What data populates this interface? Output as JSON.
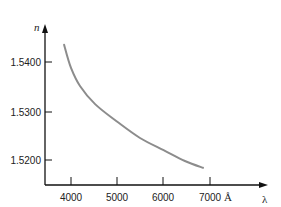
{
  "chart_data": {
    "type": "line",
    "title": "",
    "xlabel": "λ",
    "ylabel": "n",
    "x_unit": "Å",
    "xlim": [
      3450,
      7800
    ],
    "ylim": [
      1.515,
      1.548
    ],
    "grid": false,
    "legend": null,
    "x_ticks": [
      4000,
      5000,
      6000,
      7000
    ],
    "x_tick_labels": [
      "4000",
      "5000",
      "6000",
      "7000"
    ],
    "y_ticks": [
      1.54,
      1.53,
      1.52
    ],
    "y_tick_labels": [
      "1.5400",
      "1.5300",
      "1.5200"
    ],
    "series": [
      {
        "name": "refractive index vs wavelength",
        "color": "#8c8c8c",
        "x": [
          3850,
          4000,
          4195,
          4520,
          5000,
          5490,
          6000,
          6460,
          6850
        ],
        "y": [
          1.5435,
          1.5388,
          1.5351,
          1.5314,
          1.5278,
          1.5245,
          1.522,
          1.5198,
          1.5184
        ]
      }
    ]
  },
  "labels": {
    "y_axis": "n",
    "x_axis": "λ",
    "unit": "Å",
    "y_tick_1": "1.5400",
    "y_tick_2": "1.5300",
    "y_tick_3": "1.5200",
    "x_tick_1": "4000",
    "x_tick_2": "5000",
    "x_tick_3": "6000",
    "x_tick_4": "7000"
  }
}
